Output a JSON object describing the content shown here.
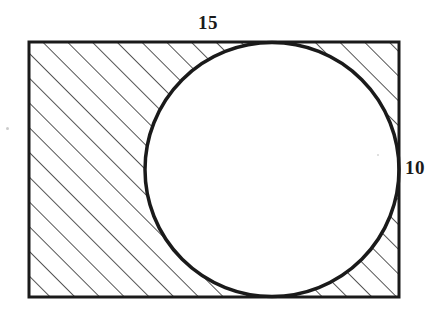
{
  "figure": {
    "background_color": "#ffffff",
    "stroke_color": "#1a1a1a",
    "hatch_color": "#2b2b2b",
    "rectangle": {
      "name": "outer-rectangle",
      "x": 29,
      "y": 42,
      "width": 370,
      "height": 255,
      "stroke_width": 3,
      "fill": "none"
    },
    "circle": {
      "name": "inscribed-circle",
      "cx": 272,
      "cy": 169.5,
      "r": 127,
      "stroke_width": 3.5,
      "fill": "#ffffff"
    },
    "hatching": {
      "name": "diagonal-hatch",
      "angle_degrees": 45,
      "direction": "lower-left-to-upper-right",
      "spacing_px": 17.5,
      "line_width": 1.6
    },
    "labels": {
      "top": {
        "name": "width-label",
        "text": "15",
        "value": 15,
        "edge": "top"
      },
      "right": {
        "name": "height-label",
        "text": "10",
        "value": 10,
        "edge": "right",
        "clipped": true
      }
    }
  }
}
